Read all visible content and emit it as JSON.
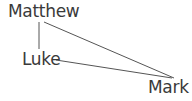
{
  "diagram": {
    "nodes": [
      {
        "id": "matthew",
        "label": "Matthew"
      },
      {
        "id": "luke",
        "label": "Luke"
      },
      {
        "id": "mark",
        "label": "Mark"
      }
    ],
    "edges": [
      {
        "from": "matthew",
        "to": "luke"
      },
      {
        "from": "matthew",
        "to": "mark"
      },
      {
        "from": "luke",
        "to": "mark"
      }
    ],
    "colors": {
      "text": "#3a3a3a",
      "line": "#555555",
      "background": "#ffffff"
    }
  }
}
